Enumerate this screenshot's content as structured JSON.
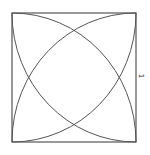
{
  "diagram": {
    "type": "geometry",
    "shape": "square with four quarter-circle arcs centered at each corner",
    "side_label": "1",
    "stroke_color": "#555555",
    "square": {
      "x": 12,
      "y": 13,
      "width": 124,
      "height": 129
    },
    "arcs": [
      {
        "center": "top-left",
        "radius": "side"
      },
      {
        "center": "top-right",
        "radius": "side"
      },
      {
        "center": "bottom-left",
        "radius": "side"
      },
      {
        "center": "bottom-right",
        "radius": "side"
      }
    ]
  }
}
